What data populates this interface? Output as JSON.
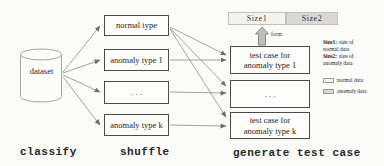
{
  "figure": {
    "dataset": {
      "label": "dataset"
    },
    "type_boxes": [
      {
        "label": "normal type"
      },
      {
        "label": "anomaly type 1"
      },
      {
        "label": ". . ."
      },
      {
        "label": "anomaly type k"
      }
    ],
    "test_boxes": [
      {
        "lines": [
          "test case for",
          "anomaly type 1"
        ]
      },
      {
        "lines": [
          ". . ."
        ]
      },
      {
        "lines": [
          "test case for",
          "anomaly type k"
        ]
      }
    ],
    "size_bar": {
      "size1": "Size1",
      "size2": "Size2"
    },
    "form_arrow_label": "form",
    "note": {
      "l1_bold": "Size1:",
      "l1_rest": "size of",
      "l2": "normal data",
      "l3_bold": "Size2:",
      "l3_rest": "size of",
      "l4": "anomaly data"
    },
    "legend": [
      {
        "label": "normal data",
        "swatch_color": "#f5f4f0"
      },
      {
        "label": "anomaly data",
        "swatch_color": "#d9d8d4"
      }
    ],
    "stages": {
      "classify": "classify",
      "shuffle": "shuffle",
      "generate": "generate test case"
    },
    "colors": {
      "background": "#fbfbf9",
      "box_border": "#4a4a48",
      "connector_line": "#8a8a8a",
      "size1_fill": "#f3f2ee",
      "size2_fill": "#d9d8d4",
      "block_arrow_fill": "#c0bfbc"
    }
  }
}
